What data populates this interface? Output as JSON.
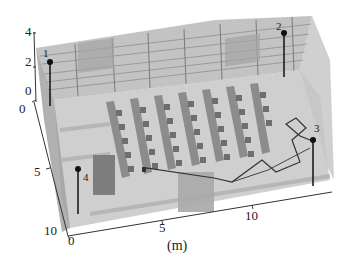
{
  "figure": {
    "unit_label": "(m)",
    "z_axis": {
      "ticks": [
        "4",
        "2",
        "0"
      ]
    },
    "y_axis": {
      "ticks": [
        "0",
        "5",
        "10"
      ]
    },
    "x_axis": {
      "ticks": [
        "0",
        "5",
        "10"
      ]
    },
    "sensors": [
      {
        "id": "1",
        "label": "1"
      },
      {
        "id": "2",
        "label": "2"
      },
      {
        "id": "3",
        "label": "3"
      },
      {
        "id": "4",
        "label": "4"
      }
    ],
    "colors": {
      "wall": "#b9b9b9",
      "floor": "#c8c8c8",
      "desk": "#8a8a8a",
      "line": "#333333"
    }
  }
}
